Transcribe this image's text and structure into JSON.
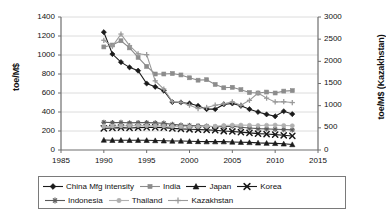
{
  "chart_data": {
    "type": "line",
    "title": "",
    "xlabel": "",
    "ylabel": "toe/M$",
    "ylabel_right": "toe/M$ (Kazakhstan)",
    "xlim": [
      1985,
      2015
    ],
    "ylim": [
      0,
      1400
    ],
    "ylim_right": [
      0,
      3000
    ],
    "xticks": [
      1985,
      1990,
      1995,
      2000,
      2005,
      2010,
      2015
    ],
    "yticks": [
      0,
      200,
      400,
      600,
      800,
      1000,
      1200,
      1400
    ],
    "yticks_right": [
      0,
      500,
      1000,
      1500,
      2000,
      2500,
      3000
    ],
    "grid": true,
    "legend_position": "bottom",
    "x": [
      1990,
      1991,
      1992,
      1993,
      1994,
      1995,
      1996,
      1997,
      1998,
      1999,
      2000,
      2001,
      2002,
      2003,
      2004,
      2005,
      2006,
      2007,
      2008,
      2009,
      2010,
      2011,
      2012
    ],
    "series": [
      {
        "name": "China Mfg intensity",
        "marker": "diamond",
        "color": "#1a1a1a",
        "axis": "left",
        "values": [
          1240,
          1010,
          925,
          870,
          835,
          700,
          665,
          625,
          505,
          500,
          490,
          465,
          430,
          430,
          480,
          490,
          465,
          430,
          400,
          375,
          355,
          408,
          378
        ]
      },
      {
        "name": "India",
        "marker": "square",
        "color": "#8c8c8c",
        "axis": "left",
        "values": [
          1085,
          1105,
          1150,
          1075,
          975,
          880,
          800,
          800,
          805,
          790,
          760,
          735,
          740,
          690,
          655,
          660,
          635,
          605,
          600,
          610,
          600,
          620,
          625
        ]
      },
      {
        "name": "Japan",
        "marker": "triangle",
        "color": "#1a1a1a",
        "axis": "left",
        "values": [
          105,
          103,
          103,
          102,
          103,
          102,
          100,
          97,
          95,
          95,
          92,
          90,
          88,
          88,
          88,
          85,
          82,
          80,
          75,
          72,
          70,
          65,
          58
        ]
      },
      {
        "name": "Korea",
        "marker": "x",
        "color": "#1a1a1a",
        "axis": "left",
        "values": [
          228,
          232,
          235,
          232,
          235,
          238,
          238,
          235,
          228,
          222,
          218,
          215,
          212,
          208,
          200,
          195,
          188,
          180,
          172,
          168,
          162,
          155,
          148
        ]
      },
      {
        "name": "Indonesia",
        "marker": "asterisk",
        "color": "#5a5a5a",
        "axis": "left",
        "values": [
          292,
          288,
          290,
          285,
          288,
          288,
          285,
          282,
          270,
          262,
          258,
          255,
          252,
          245,
          248,
          250,
          240,
          232,
          225,
          222,
          218,
          215,
          212
        ]
      },
      {
        "name": "Thailand",
        "marker": "circle",
        "color": "#b0b0b0",
        "axis": "left",
        "values": [
          248,
          250,
          252,
          255,
          258,
          255,
          255,
          252,
          248,
          245,
          245,
          245,
          248,
          250,
          258,
          262,
          262,
          260,
          258,
          260,
          262,
          258,
          255
        ]
      },
      {
        "name": "Kazakhstan",
        "marker": "plus",
        "color": "#9a9a9a",
        "axis": "right",
        "values": [
          2475,
          2340,
          2615,
          2355,
          2170,
          2150,
          1560,
          1375,
          1090,
          1075,
          1010,
          935,
          960,
          1010,
          1040,
          1085,
          1010,
          1120,
          1285,
          1170,
          1085,
          1090,
          1070
        ]
      }
    ]
  },
  "legend": {
    "rows": [
      [
        {
          "label": "China Mfg intensity",
          "marker": "diamond",
          "color": "#1a1a1a"
        },
        {
          "label": "India",
          "marker": "square",
          "color": "#8c8c8c"
        },
        {
          "label": "Japan",
          "marker": "triangle",
          "color": "#1a1a1a"
        },
        {
          "label": "Korea",
          "marker": "x",
          "color": "#1a1a1a"
        }
      ],
      [
        {
          "label": "Indonesia",
          "marker": "asterisk",
          "color": "#5a5a5a"
        },
        {
          "label": "Thailand",
          "marker": "circle",
          "color": "#b0b0b0"
        },
        {
          "label": "Kazakhstan",
          "marker": "plus",
          "color": "#9a9a9a"
        }
      ]
    ]
  },
  "colors": {
    "axis": "#6e6e6e",
    "grid": "#dcdcdc",
    "text": "#111111",
    "background": "#ffffff",
    "legend_border": "#7a7a7a"
  }
}
